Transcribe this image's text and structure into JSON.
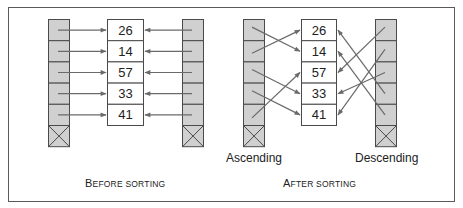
{
  "colors": {
    "frame": "#5a5a5a",
    "slot_fill": "#d0d0d0",
    "slot_stroke": "#4a4a4a",
    "arrow": "#6a6a6a",
    "data_fill": "#ffffff"
  },
  "values": [
    "26",
    "14",
    "57",
    "33",
    "41"
  ],
  "before": {
    "caption_first": "B",
    "caption_rest": "EFORE SORTING",
    "caption": "Before sorting",
    "left_targets": [
      0,
      1,
      2,
      3,
      4
    ],
    "right_targets": [
      0,
      1,
      2,
      3,
      4
    ]
  },
  "after": {
    "caption_first": "A",
    "caption_rest": "FTER SORTING",
    "caption": "After sorting",
    "ascending_label": "Ascending",
    "descending_label": "Descending",
    "ascending_targets": [
      1,
      0,
      3,
      4,
      2
    ],
    "descending_targets": [
      2,
      4,
      3,
      0,
      1
    ],
    "ascending_order": [
      "14",
      "26",
      "33",
      "41",
      "57"
    ],
    "descending_order": [
      "57",
      "41",
      "33",
      "26",
      "14"
    ]
  }
}
